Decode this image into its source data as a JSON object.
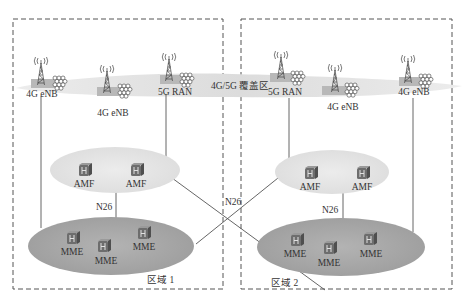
{
  "coverage_band": {
    "label": "4G/5G 覆盖区",
    "color": "#e3e3e3"
  },
  "zones": [
    {
      "id": "zone1",
      "label": "区域 1"
    },
    {
      "id": "zone2",
      "label": "区域 2"
    }
  ],
  "base_stations": [
    {
      "id": "bs1",
      "label": "4G eNB",
      "zone": "zone1"
    },
    {
      "id": "bs2",
      "label": "4G eNB",
      "zone": "zone1"
    },
    {
      "id": "bs3",
      "label": "5G RAN",
      "zone": "zone1"
    },
    {
      "id": "bs4",
      "label": "5G RAN",
      "zone": "zone2"
    },
    {
      "id": "bs5",
      "label": "4G eNB",
      "zone": "zone2"
    },
    {
      "id": "bs6",
      "label": "4G eNB",
      "zone": "zone2"
    }
  ],
  "amf_pools": [
    {
      "zone": "zone1",
      "nodes": [
        {
          "label": "AMF"
        },
        {
          "label": "AMF"
        }
      ]
    },
    {
      "zone": "zone2",
      "nodes": [
        {
          "label": "AMF"
        },
        {
          "label": "AMF"
        }
      ]
    }
  ],
  "mme_pools": [
    {
      "zone": "zone1",
      "nodes": [
        {
          "label": "MME"
        },
        {
          "label": "MME"
        },
        {
          "label": "MME"
        }
      ]
    },
    {
      "zone": "zone2",
      "nodes": [
        {
          "label": "MME"
        },
        {
          "label": "MME"
        },
        {
          "label": "MME"
        }
      ]
    }
  ],
  "interfaces": {
    "zone1_n26": "N26",
    "zone2_n26": "N26",
    "cross_n26": "N26"
  },
  "colors": {
    "amf_ellipse": "#e6e6e6",
    "mme_ellipse": "#a9a9a9",
    "line": "#555555",
    "dash_border": "#555555",
    "station_pad": "#b8b8b8",
    "node_icon": "#6d6d6d"
  }
}
